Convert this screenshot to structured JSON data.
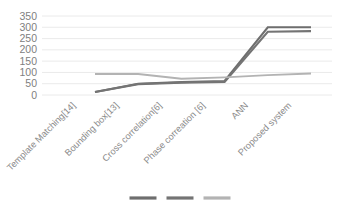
{
  "chart_data": {
    "type": "line",
    "title": "",
    "subtitle": "",
    "xlabel": "",
    "ylabel": "",
    "ylim": [
      0,
      350
    ],
    "yticks": [
      0,
      50,
      100,
      150,
      200,
      250,
      300,
      350
    ],
    "ytick_labels": [
      "0",
      "50",
      "100",
      "150",
      "200",
      "250",
      "300",
      "350"
    ],
    "grid": true,
    "legend_position": "bottom",
    "legend_labels_visible": false,
    "categories": [
      "Template Matching[14]",
      "Bounding box[13]",
      "Cross correlation[6]",
      "Phase correation [6]",
      "ANN",
      "Proposed system"
    ],
    "series": [
      {
        "name": "series-1",
        "color": "#6e6e6e",
        "values": [
          13,
          50,
          57,
          62,
          300,
          300
        ]
      },
      {
        "name": "series-2",
        "color": "#747474",
        "values": [
          13,
          48,
          55,
          58,
          280,
          283
        ]
      },
      {
        "name": "series-3",
        "color": "#b3b3b3",
        "values": [
          93,
          93,
          72,
          78,
          88,
          95
        ]
      }
    ]
  },
  "legend": {
    "items": [
      {
        "name": "legend-item-1",
        "color": "#6e6e6e",
        "label": ""
      },
      {
        "name": "legend-item-2",
        "color": "#747474",
        "label": ""
      },
      {
        "name": "legend-item-3",
        "color": "#b3b3b3",
        "label": ""
      }
    ]
  },
  "colors": {
    "background": "#ffffff",
    "gridline": "#e8e8e8",
    "tick_text": "#808080",
    "category_text": "#8a8a8a",
    "series_dark": "#6e6e6e",
    "series_dark_alt": "#747474",
    "series_light": "#b3b3b3"
  }
}
